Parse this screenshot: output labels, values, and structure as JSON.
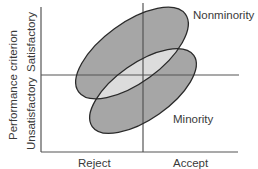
{
  "diagram": {
    "y_axis_title": "Performance criterion",
    "y_axis_levels": [
      "Satisfactory",
      "Unsatisfactory"
    ],
    "x_axis_levels": [
      "Reject",
      "Accept"
    ],
    "groups": [
      {
        "name": "Nonminority",
        "cx": 132,
        "cy": 53,
        "rx": 66,
        "ry": 30,
        "rotation": -36
      },
      {
        "name": "Minority",
        "cx": 143,
        "cy": 91,
        "rx": 62,
        "ry": 28,
        "rotation": -35
      }
    ],
    "colors": {
      "ellipse_fill": "#a6a6a6",
      "overlap_fill": "#dcdcdc",
      "outline": "#2a2a2a",
      "axis": "#555555",
      "text": "#3a3a3a"
    }
  }
}
